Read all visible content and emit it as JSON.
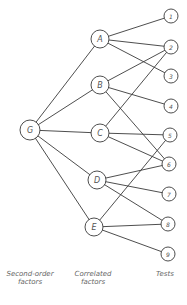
{
  "diagram": {
    "nodes": [
      {
        "id": "G",
        "label": "G",
        "x": 30,
        "y": 130,
        "r": 10,
        "level": "second-order"
      },
      {
        "id": "A",
        "label": "A",
        "x": 100,
        "y": 39,
        "r": 9,
        "level": "correlated"
      },
      {
        "id": "B",
        "label": "B",
        "x": 100,
        "y": 85,
        "r": 9,
        "level": "correlated"
      },
      {
        "id": "C",
        "label": "C",
        "x": 100,
        "y": 133,
        "r": 9,
        "level": "correlated"
      },
      {
        "id": "D",
        "label": "D",
        "x": 97,
        "y": 180,
        "r": 9,
        "level": "correlated"
      },
      {
        "id": "E",
        "label": "E",
        "x": 94,
        "y": 227,
        "r": 9,
        "level": "correlated"
      },
      {
        "id": "1",
        "label": "1",
        "x": 171,
        "y": 16,
        "r": 7,
        "level": "test"
      },
      {
        "id": "2",
        "label": "2",
        "x": 171,
        "y": 47,
        "r": 7,
        "level": "test"
      },
      {
        "id": "3",
        "label": "3",
        "x": 171,
        "y": 76,
        "r": 7,
        "level": "test"
      },
      {
        "id": "4",
        "label": "4",
        "x": 171,
        "y": 106,
        "r": 7,
        "level": "test"
      },
      {
        "id": "5",
        "label": "5",
        "x": 170,
        "y": 135,
        "r": 7,
        "level": "test"
      },
      {
        "id": "6",
        "label": "6",
        "x": 169,
        "y": 164,
        "r": 7,
        "level": "test"
      },
      {
        "id": "7",
        "label": "7",
        "x": 169,
        "y": 194,
        "r": 7,
        "level": "test"
      },
      {
        "id": "8",
        "label": "8",
        "x": 168,
        "y": 224,
        "r": 7,
        "level": "test"
      },
      {
        "id": "9",
        "label": "9",
        "x": 168,
        "y": 254,
        "r": 7,
        "level": "test"
      }
    ],
    "edges": [
      [
        "G",
        "A"
      ],
      [
        "G",
        "B"
      ],
      [
        "G",
        "C"
      ],
      [
        "G",
        "D"
      ],
      [
        "G",
        "E"
      ],
      [
        "A",
        "1"
      ],
      [
        "A",
        "2"
      ],
      [
        "A",
        "3"
      ],
      [
        "B",
        "2"
      ],
      [
        "B",
        "4"
      ],
      [
        "B",
        "6"
      ],
      [
        "C",
        "2"
      ],
      [
        "C",
        "5"
      ],
      [
        "C",
        "6"
      ],
      [
        "D",
        "6"
      ],
      [
        "D",
        "7"
      ],
      [
        "D",
        "8"
      ],
      [
        "E",
        "5"
      ],
      [
        "E",
        "8"
      ],
      [
        "E",
        "9"
      ]
    ]
  },
  "captions": {
    "second_order": "Second-order factors",
    "correlated": "Correlated factors",
    "tests": "Tests"
  }
}
